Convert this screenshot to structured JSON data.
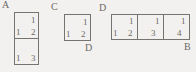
{
  "diagram": {
    "background_color": "#f2f1ef",
    "stroke_color": "#77746f",
    "text_color": "#6d6a66",
    "figures": [
      {
        "id": "fig-a",
        "shape": "vertical-domino",
        "cells": 2,
        "corner_labels": [
          {
            "text": "A",
            "position": "top-left-outside"
          }
        ],
        "numbers": [
          {
            "text": "1",
            "cell": 0,
            "corner": "top-right"
          },
          {
            "text": "1",
            "cell": 0,
            "corner": "bottom-left"
          },
          {
            "text": "2",
            "cell": 0,
            "corner": "bottom-right"
          },
          {
            "text": "1",
            "cell": 1,
            "corner": "bottom-left"
          },
          {
            "text": "3",
            "cell": 1,
            "corner": "bottom-right"
          }
        ]
      },
      {
        "id": "fig-c",
        "shape": "single-square",
        "cells": 1,
        "corner_labels": [
          {
            "text": "C",
            "position": "top-left-outside"
          },
          {
            "text": "D",
            "position": "bottom-right-outside"
          }
        ],
        "numbers": [
          {
            "text": "1",
            "cell": 0,
            "corner": "top-right"
          },
          {
            "text": "1",
            "cell": 0,
            "corner": "bottom-left"
          },
          {
            "text": "2",
            "cell": 0,
            "corner": "bottom-right"
          }
        ]
      },
      {
        "id": "fig-d",
        "shape": "horizontal-tromino",
        "cells": 3,
        "corner_labels": [
          {
            "text": "D",
            "position": "top-left-outside"
          },
          {
            "text": "B",
            "position": "bottom-right-outside"
          }
        ],
        "numbers": [
          {
            "text": "1",
            "cell": 0,
            "corner": "top-right"
          },
          {
            "text": "1",
            "cell": 0,
            "corner": "bottom-left"
          },
          {
            "text": "2",
            "cell": 0,
            "corner": "bottom-right"
          },
          {
            "text": "1",
            "cell": 1,
            "corner": "top-right"
          },
          {
            "text": "3",
            "cell": 1,
            "corner": "bottom-right"
          },
          {
            "text": "1",
            "cell": 2,
            "corner": "top-right"
          },
          {
            "text": "4",
            "cell": 2,
            "corner": "bottom-right"
          }
        ]
      }
    ]
  }
}
